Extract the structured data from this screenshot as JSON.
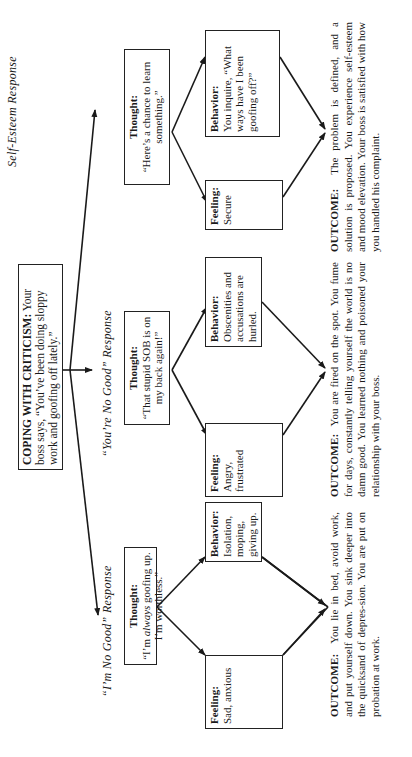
{
  "header": {
    "title": "COPING WITH CRITICISM:",
    "text": "Your boss says, “You’ve been doing sloppy work and goofing off lately.”"
  },
  "branches": [
    {
      "label": "“I’m No Good” Response",
      "thought": {
        "title": "Thought:",
        "text_pre": "“I’m ",
        "text_em": "always",
        "text_post": " goofing up. I’m worthless.”"
      },
      "feeling": {
        "title": "Feeling:",
        "text": "Sad, anxious"
      },
      "behavior": {
        "title": "Behavior:",
        "text": "Isolation, moping, giving up."
      },
      "outcome": {
        "title": "OUTCOME:",
        "text": "You lie in bed, avoid work, and put yourself down. You sink deeper into the quicksand of depres-sion. You are put on probation at work."
      }
    },
    {
      "label": "“You’re No Good” Response",
      "thought": {
        "title": "Thought:",
        "text": "“That stupid SOB is on my back again!”"
      },
      "feeling": {
        "title": "Feeling:",
        "text": "Angry, frustrated"
      },
      "behavior": {
        "title": "Behavior:",
        "text": "Obscenities and accusations are hurled."
      },
      "outcome": {
        "title": "OUTCOME:",
        "text": "You are fired on the spot. You fume for days, constantly telling yourself the world is no damn good. You learned nothing and poisoned your relationship with your boss."
      }
    },
    {
      "label": "Self-Esteem Response",
      "thought": {
        "title": "Thought:",
        "text": "“Here’s a chance to learn something.”"
      },
      "feeling": {
        "title": "Feeling:",
        "text": "Secure"
      },
      "behavior": {
        "title": "Behavior:",
        "text": "You inquire, “What ways have I been goofing off?”"
      },
      "outcome": {
        "title": "OUTCOME:",
        "text": "The problem is defined, and a solution is proposed. You experience self-esteem and mood elevation. Your boss is satisfied with how you handled his complaint."
      }
    }
  ],
  "orientation": {
    "rotation_deg": -90
  },
  "colors": {
    "ink": "#1a1a1a",
    "paper": "#ffffff"
  }
}
